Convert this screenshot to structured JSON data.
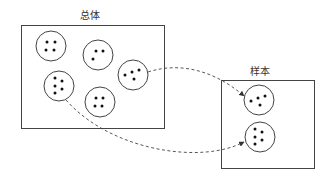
{
  "diagram": {
    "population": {
      "title": "总体",
      "box": {
        "x": 21,
        "y": 25,
        "w": 143,
        "h": 103
      },
      "groups": [
        {
          "id": "g1",
          "cx": 51,
          "cy": 46,
          "r": 15,
          "dots": [
            [
              47,
              42
            ],
            [
              55,
              42
            ],
            [
              46,
              50
            ],
            [
              54,
              50
            ]
          ]
        },
        {
          "id": "g2",
          "cx": 98,
          "cy": 55,
          "r": 15,
          "dots": [
            [
              96,
              51
            ],
            [
              103,
              51
            ],
            [
              93,
              59
            ]
          ]
        },
        {
          "id": "g3",
          "cx": 133,
          "cy": 75,
          "r": 15,
          "dots": [
            [
              125,
              75
            ],
            [
              132,
              72
            ],
            [
              139,
              70
            ],
            [
              134,
              79
            ]
          ]
        },
        {
          "id": "g4",
          "cx": 59,
          "cy": 86,
          "r": 15,
          "dots": [
            [
              55,
              78
            ],
            [
              62,
              81
            ],
            [
              55,
              86
            ],
            [
              62,
              89
            ],
            [
              55,
              93
            ]
          ]
        },
        {
          "id": "g5",
          "cx": 100,
          "cy": 102,
          "r": 15,
          "dots": [
            [
              96,
              98
            ],
            [
              103,
              98
            ],
            [
              95,
              106
            ],
            [
              102,
              106
            ]
          ]
        }
      ]
    },
    "sample": {
      "title": "样本",
      "box": {
        "x": 221,
        "y": 80,
        "w": 93,
        "h": 88
      },
      "groups": [
        {
          "id": "s1",
          "cx": 259,
          "cy": 100,
          "r": 15,
          "dots": [
            [
              251,
              101
            ],
            [
              258,
              98
            ],
            [
              265,
              96
            ],
            [
              260,
              105
            ]
          ]
        },
        {
          "id": "s2",
          "cx": 260,
          "cy": 137,
          "r": 15,
          "dots": [
            [
              255,
              129
            ],
            [
              262,
              132
            ],
            [
              255,
              137
            ],
            [
              262,
              140
            ],
            [
              255,
              144
            ]
          ]
        }
      ]
    },
    "arrows": [
      {
        "from": "g3",
        "to": "s1",
        "style": "dashed",
        "path": "M 148 72 C 185 60, 220 75, 244 96"
      },
      {
        "from": "g4",
        "to": "s2",
        "style": "dashed",
        "path": "M 66 100 C 110 150, 200 165, 244 142"
      }
    ],
    "colors": {
      "stroke": "#444444",
      "dot": "#111111",
      "background": "#ffffff"
    }
  }
}
